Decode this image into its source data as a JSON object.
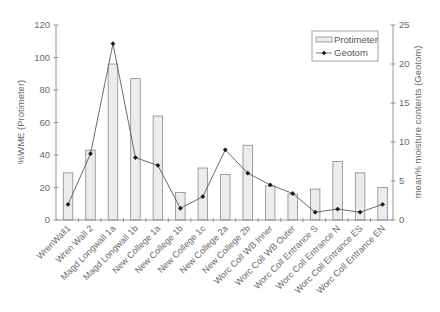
{
  "chart_data": {
    "type": "bar",
    "title": "",
    "xlabel": "",
    "categories": [
      "WrenWall1",
      "Wren Wall 2",
      "Magd Longwall 1a",
      "Magd Longwall 1b",
      "New College 1a",
      "New College 1b",
      "New College 1c",
      "New College 2a",
      "New College 2b",
      "Worc Coll WB Inner",
      "Worc Coll WB Outer",
      "Worc Coll Entrance S",
      "Worc Coll Entrance N",
      "Worc Coll Entrance ES",
      "Worc Coll Entrance EN"
    ],
    "series": [
      {
        "name": "Protimeter",
        "kind": "bar",
        "axis": "left",
        "values": [
          29,
          43,
          96,
          87,
          64,
          17,
          32,
          28,
          46,
          21,
          16,
          19,
          36,
          29,
          20
        ]
      },
      {
        "name": "Geotom",
        "kind": "line",
        "axis": "right",
        "values": [
          2.0,
          8.5,
          22.6,
          8.0,
          7.0,
          1.5,
          3.0,
          9.0,
          6.0,
          4.5,
          3.4,
          1.0,
          1.4,
          1.0,
          2.0
        ]
      }
    ],
    "ylabel": "%WME (Protimeter)",
    "ylim": [
      0,
      120
    ],
    "yticks": [
      0,
      20,
      40,
      60,
      80,
      100,
      120
    ],
    "y2label": "mean% moisture contents (Geotom)",
    "y2lim": [
      0,
      25
    ],
    "y2ticks": [
      0,
      5,
      10,
      15,
      20,
      25
    ],
    "grid": false,
    "legend_position": "upper right"
  },
  "colors": {
    "bar_fill": "#ececec",
    "bar_stroke": "#8a8a8a",
    "line": "#5a5a5a",
    "marker": "#1a1a1a",
    "axis": "#8a8a8a",
    "text": "#6a6a6a"
  }
}
